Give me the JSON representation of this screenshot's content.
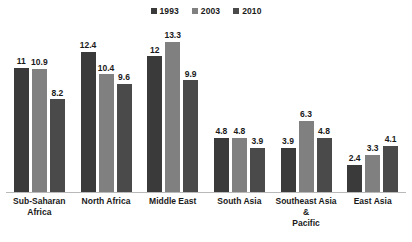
{
  "chart_data": {
    "type": "bar",
    "title": "",
    "subtitle": "",
    "xlabel": "",
    "ylabel": "",
    "ylim": [
      0,
      14
    ],
    "grid": false,
    "legend_position": "top-center",
    "orientation": "vertical",
    "grouping": "grouped",
    "categories": [
      "Sub-Saharan Africa",
      "North Africa",
      "Middle East",
      "South Asia",
      "Southeast Asia & Pacific",
      "East Asia"
    ],
    "category_lines": [
      [
        "Sub-Saharan",
        "Africa"
      ],
      [
        "North Africa"
      ],
      [
        "Middle East"
      ],
      [
        "South Asia"
      ],
      [
        "Southeast Asia &",
        "Pacific"
      ],
      [
        "East Asia"
      ]
    ],
    "series": [
      {
        "name": "1993",
        "color": "#3a3a3a",
        "values": [
          11,
          12.4,
          12,
          4.8,
          3.9,
          2.4
        ],
        "labels": [
          "11",
          "12.4",
          "12",
          "4.8",
          "3.9",
          "2.4"
        ]
      },
      {
        "name": "2003",
        "color": "#808080",
        "values": [
          10.9,
          10.4,
          13.3,
          4.8,
          6.3,
          3.3
        ],
        "labels": [
          "10.9",
          "10.4",
          "13.3",
          "4.8",
          "6.3",
          "3.3"
        ]
      },
      {
        "name": "2010",
        "color": "#4a4a4a",
        "values": [
          8.2,
          9.6,
          9.9,
          3.9,
          4.8,
          4.1
        ],
        "labels": [
          "8.2",
          "9.6",
          "9.9",
          "3.9",
          "4.8",
          "4.1"
        ]
      }
    ]
  },
  "legend": {
    "items": [
      {
        "label": "1993",
        "color": "#3a3a3a"
      },
      {
        "label": "2003",
        "color": "#808080"
      },
      {
        "label": "2010",
        "color": "#4a4a4a"
      }
    ]
  },
  "axis": {
    "baseline_color": "#b9b9b9"
  }
}
